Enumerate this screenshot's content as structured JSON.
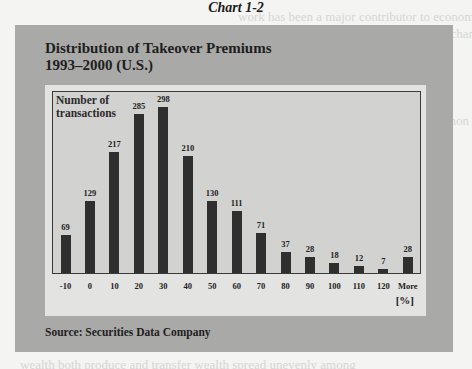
{
  "page": {
    "caption": "Chart 1-2"
  },
  "chart": {
    "title_line1": "Distribution of Takeover Premiums",
    "title_line2": "1993–2000 (U.S.)",
    "ylabel_line1": "Number of",
    "ylabel_line2": "transactions",
    "unit": "[%]",
    "source": "Source: Securities Data Company"
  },
  "chart_data": {
    "type": "bar",
    "title": "Distribution of Takeover Premiums 1993–2000 (U.S.)",
    "xlabel": "[%]",
    "ylabel": "Number of transactions",
    "categories": [
      "-10",
      "0",
      "10",
      "20",
      "30",
      "40",
      "50",
      "60",
      "70",
      "80",
      "90",
      "100",
      "110",
      "120",
      "More"
    ],
    "values": [
      69,
      129,
      217,
      285,
      298,
      210,
      130,
      111,
      71,
      37,
      28,
      18,
      12,
      7,
      28
    ],
    "data_labels": true,
    "grid": false,
    "legend": null,
    "ylim": [
      0,
      300
    ],
    "bar_color": "#2f2f2f",
    "source": "Securities Data Company"
  }
}
